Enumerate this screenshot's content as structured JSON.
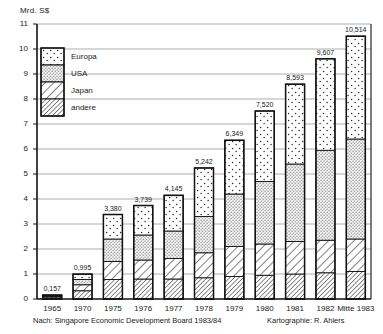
{
  "chart_data": {
    "type": "bar",
    "subtype": "stacked-bar",
    "title": "",
    "ylabel": "Mrd. S$",
    "xlabel": "",
    "ylim": [
      0,
      11
    ],
    "ytick_labels": [
      "0",
      "1",
      "2",
      "3",
      "4",
      "5",
      "6",
      "7",
      "8",
      "9",
      "10",
      "11"
    ],
    "yticks": [
      0,
      1,
      2,
      3,
      4,
      5,
      6,
      7,
      8,
      9,
      10,
      11
    ],
    "grid": true,
    "grid_axis": "y",
    "categories": [
      "1965",
      "1970",
      "1975",
      "1976",
      "1977",
      "1978",
      "1979",
      "1980",
      "1981",
      "1982",
      "Mitte 1983"
    ],
    "totals": [
      0.157,
      0.995,
      3.38,
      3.739,
      4.145,
      5.242,
      6.349,
      7.52,
      8.593,
      9.607,
      10.514
    ],
    "total_labels": [
      "0,157",
      "0,995",
      "3,380",
      "3,739",
      "4,145",
      "5,242",
      "6,349",
      "7,520",
      "8,593",
      "9,607",
      "10,514"
    ],
    "legend_position": "upper-left-inside",
    "series": [
      {
        "name": "andere",
        "pattern": "dense-diagonal-hatch",
        "color": "#ffffff",
        "values": [
          0.08,
          0.33,
          0.78,
          0.8,
          0.8,
          0.85,
          0.9,
          0.95,
          1.0,
          1.05,
          1.1
        ]
      },
      {
        "name": "Japan",
        "pattern": "diagonal-hatch",
        "color": "#ffffff",
        "values": [
          0.04,
          0.24,
          0.72,
          0.76,
          0.82,
          1.0,
          1.2,
          1.25,
          1.3,
          1.3,
          1.3
        ]
      },
      {
        "name": "USA",
        "pattern": "dense-dots",
        "color": "#f2f2f2",
        "values": [
          0.03,
          0.21,
          0.9,
          1.0,
          1.1,
          1.45,
          2.1,
          2.5,
          3.1,
          3.6,
          4.0
        ]
      },
      {
        "name": "Europa",
        "pattern": "sparse-dots",
        "color": "#fbfbfb",
        "values": [
          0.007,
          0.215,
          0.98,
          1.18,
          1.43,
          1.94,
          2.15,
          2.82,
          3.19,
          3.66,
          4.11
        ]
      }
    ]
  },
  "legend": {
    "items": [
      {
        "label": "Europa",
        "pattern": "sparse-dots"
      },
      {
        "label": "USA",
        "pattern": "dense-dots"
      },
      {
        "label": "Japan",
        "pattern": "diagonal-hatch"
      },
      {
        "label": "andere",
        "pattern": "dense-diagonal-hatch"
      }
    ]
  },
  "footer": {
    "source_note": "Nach: Singapore Economic Development Board 1983/84",
    "cartography_note": "Kartographie: R. Ahlers"
  }
}
